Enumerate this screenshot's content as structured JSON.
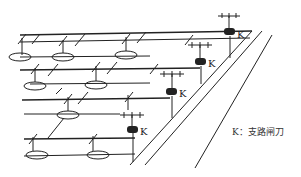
{
  "diagram": {
    "type": "electrical branch wiring layout",
    "switch_label": "K",
    "switch_count": 4,
    "legend": {
      "symbol": "K",
      "separator": "：",
      "description": "支路闸刀"
    },
    "colors": {
      "line": "#222222",
      "background": "#ffffff"
    }
  }
}
